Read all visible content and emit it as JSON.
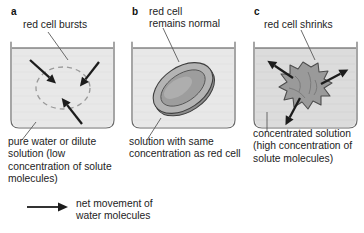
{
  "figure": {
    "background_color": "#ffffff",
    "text_color": "#1d1d1d"
  },
  "panels": [
    {
      "letter": "a",
      "cell_label": "red cell bursts",
      "caption": "pure water or dilute solution (low concentration of solute molecules)",
      "cell_state": "burst",
      "cell_shape": "dashed-circle",
      "water_direction": "inward",
      "arrow_count": 3,
      "solution_fill": "#e6e6e6"
    },
    {
      "letter": "b",
      "cell_label": "red cell\nremains normal",
      "caption": "solution with same concentration as red cell",
      "cell_state": "normal",
      "cell_shape": "biconcave-disc",
      "water_direction": "none",
      "arrow_count": 0,
      "solution_fill": "#e6e6e6"
    },
    {
      "letter": "c",
      "cell_label": "red cell shrinks",
      "caption": "concentrated solution (high concentration of solute molecules)",
      "cell_state": "shrunken",
      "cell_shape": "crenated-blob",
      "water_direction": "outward",
      "arrow_count": 3,
      "solution_fill": "#d8d8d8"
    }
  ],
  "legend": {
    "icon": "right-arrow-icon",
    "text": "net movement of\nwater molecules"
  }
}
